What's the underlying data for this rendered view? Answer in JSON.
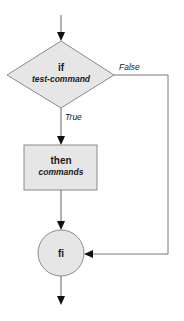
{
  "flowchart": {
    "title": "if-then flowchart",
    "nodes": {
      "decision": {
        "keyword": "if",
        "text": "test-command"
      },
      "process": {
        "keyword": "then",
        "text": "commands"
      },
      "end": {
        "keyword": "fi"
      }
    },
    "edges": {
      "true_label": "True",
      "false_label": "False"
    },
    "colors": {
      "fill": "#e6e6e6",
      "stroke": "#8a8a8a",
      "line": "#555555",
      "arrow": "#111111",
      "text": "#1a1a1a"
    }
  }
}
